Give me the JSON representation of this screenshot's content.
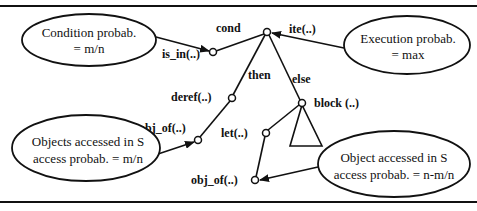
{
  "nodes": {
    "root": "ite(..)",
    "cond_label": "cond",
    "is_in": "is_in(..)",
    "then_label": "then",
    "else_label": "else",
    "deref": "deref(..)",
    "obj_of_left": "obj_of(..)",
    "block": "block (..)",
    "let": "let(..)",
    "obj_of_bottom": "obj_of(..)"
  },
  "annotations": {
    "condition": {
      "line1": "Condition probab.",
      "line2": "= m/n"
    },
    "execution": {
      "line1": "Execution probab.",
      "line2": "= max"
    },
    "objects_left": {
      "line1": "Objects accessed in S",
      "line2": "access probab. = m/n"
    },
    "object_right": {
      "line1": "Object accessed in S",
      "line2": "access probab. = n-m/n"
    }
  }
}
